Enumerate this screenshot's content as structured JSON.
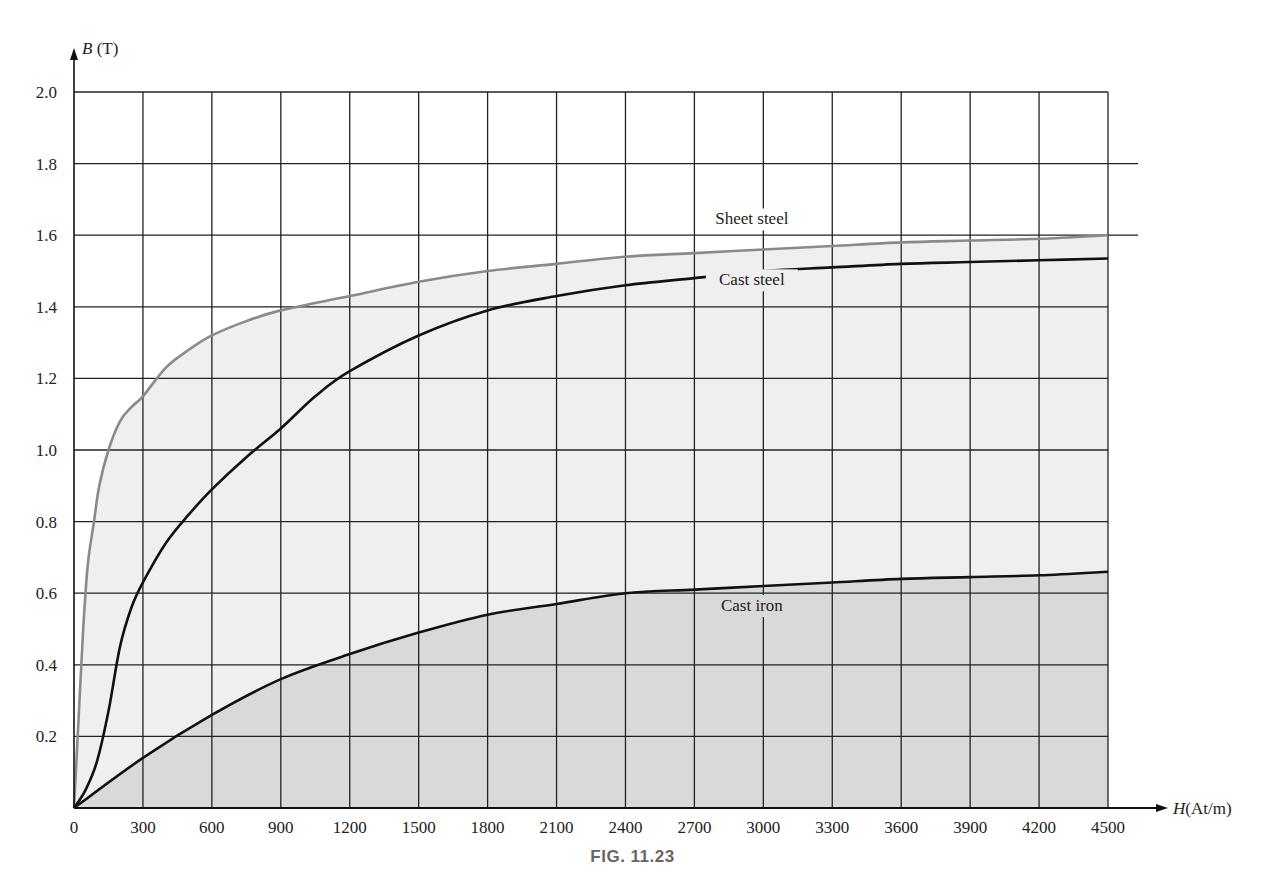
{
  "figure": {
    "caption": "FIG. 11.23"
  },
  "colors": {
    "grid": "#222222",
    "sheet_steel": "#8a8a8a",
    "cast_steel": "#111111",
    "cast_iron": "#111111",
    "fill_light": "#efefef",
    "fill_dark": "#d9d9d9"
  },
  "chart_data": {
    "type": "line",
    "title": "",
    "xlabel": "H(At/m)",
    "ylabel": "B (T)",
    "xlim": [
      0,
      4500
    ],
    "ylim": [
      0,
      2.0
    ],
    "grid": true,
    "x_ticks": [
      0,
      300,
      600,
      900,
      1200,
      1500,
      1800,
      2100,
      2400,
      2700,
      3000,
      3300,
      3600,
      3900,
      4200,
      4500
    ],
    "y_ticks": [
      0.2,
      0.4,
      0.6,
      0.8,
      1.0,
      1.2,
      1.4,
      1.6,
      1.8,
      2.0
    ],
    "y_tick_labels": [
      "0.2",
      "0.4",
      "0.6",
      "0.8",
      "1.0",
      "1.2",
      "1.4",
      "1.6",
      "1.8",
      "2.0"
    ],
    "series": [
      {
        "name": "Sheet steel",
        "x": [
          0,
          20,
          40,
          60,
          87,
          110,
          150,
          200,
          250,
          300,
          400,
          500,
          600,
          750,
          900,
          1200,
          1500,
          1800,
          2100,
          2400,
          2700,
          3000,
          3300,
          3600,
          3900,
          4200,
          4500
        ],
        "values": [
          0,
          0.25,
          0.5,
          0.68,
          0.8,
          0.9,
          1.0,
          1.08,
          1.12,
          1.15,
          1.23,
          1.28,
          1.32,
          1.36,
          1.39,
          1.43,
          1.47,
          1.5,
          1.52,
          1.54,
          1.55,
          1.56,
          1.57,
          1.58,
          1.585,
          1.59,
          1.6
        ]
      },
      {
        "name": "Cast steel",
        "x": [
          0,
          50,
          100,
          150,
          200,
          250,
          300,
          400,
          500,
          600,
          750,
          900,
          1050,
          1200,
          1500,
          1800,
          2100,
          2400,
          2700,
          3000,
          3300,
          3600,
          3900,
          4200,
          4500
        ],
        "values": [
          0,
          0.05,
          0.13,
          0.27,
          0.45,
          0.56,
          0.63,
          0.74,
          0.82,
          0.89,
          0.98,
          1.06,
          1.15,
          1.22,
          1.32,
          1.39,
          1.43,
          1.46,
          1.48,
          1.5,
          1.51,
          1.52,
          1.525,
          1.53,
          1.535
        ]
      },
      {
        "name": "Cast iron",
        "x": [
          0,
          300,
          600,
          900,
          1200,
          1500,
          1800,
          2100,
          2400,
          2700,
          3000,
          3300,
          3600,
          3900,
          4200,
          4500
        ],
        "values": [
          0,
          0.14,
          0.26,
          0.36,
          0.43,
          0.49,
          0.54,
          0.57,
          0.6,
          0.61,
          0.62,
          0.63,
          0.64,
          0.645,
          0.65,
          0.66
        ]
      }
    ],
    "annotations": [
      {
        "text": "Sheet steel",
        "x": 2950,
        "y": 1.63
      },
      {
        "text": "Cast steel",
        "x": 2950,
        "y": 1.46
      },
      {
        "text": "Cast iron",
        "x": 2950,
        "y": 0.55
      }
    ],
    "legend": "inline labels"
  }
}
